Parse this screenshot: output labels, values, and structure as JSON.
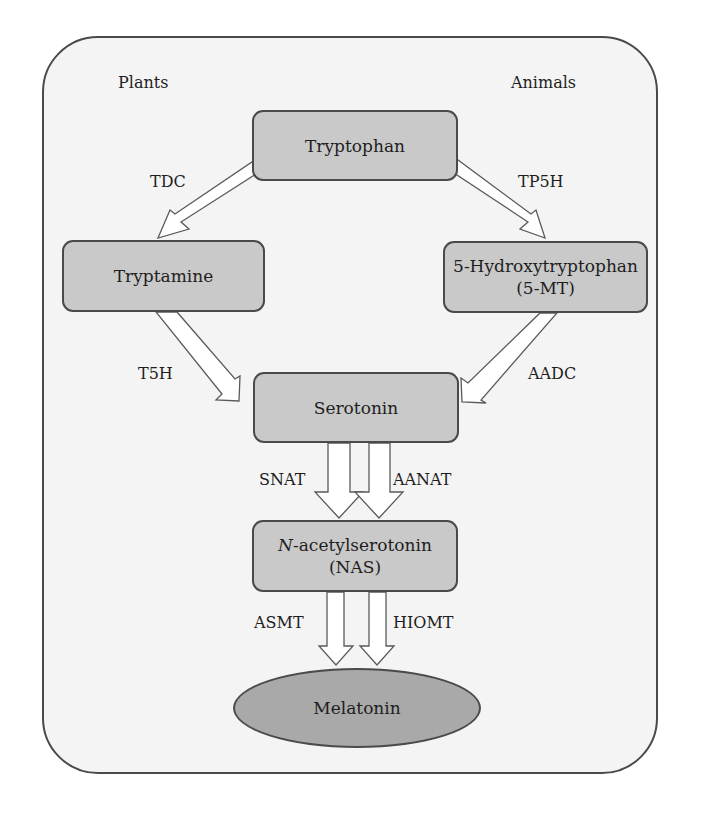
{
  "diagram": {
    "group_labels": {
      "left": "Plants",
      "right": "Animals"
    },
    "nodes": {
      "tryptophan": {
        "label": "Tryptophan"
      },
      "tryptamine": {
        "label": "Tryptamine"
      },
      "hydroxytryptophan": {
        "line1": "5-Hydroxytryptophan",
        "line2": "(5-MT)"
      },
      "serotonin": {
        "label": "Serotonin"
      },
      "nas": {
        "line1_italic": "N",
        "line1_rest": "-acetylserotonin",
        "line2": "(NAS)"
      },
      "melatonin": {
        "label": "Melatonin"
      }
    },
    "enzymes": {
      "tdc": "TDC",
      "tp5h": "TP5H",
      "t5h": "T5H",
      "aadc": "AADC",
      "snat": "SNAT",
      "aanat": "AANAT",
      "asmt": "ASMT",
      "hiomt": "HIOMT"
    },
    "edges": [
      {
        "from": "Tryptophan",
        "to": "Tryptamine",
        "enzyme": "TDC"
      },
      {
        "from": "Tryptophan",
        "to": "5-Hydroxytryptophan",
        "enzyme": "TP5H"
      },
      {
        "from": "Tryptamine",
        "to": "Serotonin",
        "enzyme": "T5H"
      },
      {
        "from": "5-Hydroxytryptophan",
        "to": "Serotonin",
        "enzyme": "AADC"
      },
      {
        "from": "Serotonin",
        "to": "N-acetylserotonin",
        "enzyme": "SNAT"
      },
      {
        "from": "Serotonin",
        "to": "N-acetylserotonin",
        "enzyme": "AANAT"
      },
      {
        "from": "N-acetylserotonin",
        "to": "Melatonin",
        "enzyme": "ASMT"
      },
      {
        "from": "N-acetylserotonin",
        "to": "Melatonin",
        "enzyme": "HIOMT"
      }
    ],
    "colors": {
      "frame_fill": "#f4f4f4",
      "box_fill": "#c9c9c9",
      "ellipse_fill": "#a9a9a9",
      "stroke": "#4a4a4a",
      "arrow_fill": "#ffffff"
    }
  }
}
